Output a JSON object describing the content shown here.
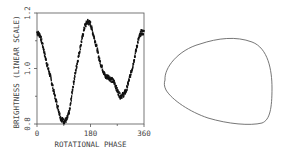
{
  "chart_data": [
    {
      "type": "scatter",
      "title": "",
      "xlabel": "ROTATIONAL PHASE",
      "ylabel": "BRIGHTNESS (LINEAR SCALE)",
      "xlim": [
        0,
        360
      ],
      "ylim": [
        0.8,
        1.2
      ],
      "xticks": [
        "0",
        "180",
        "360"
      ],
      "yticks": [
        "0.8",
        "1.0",
        "1.2"
      ],
      "grid": false,
      "legend": null,
      "series": [
        {
          "name": "lightcurve",
          "x": [
            0,
            10,
            20,
            30,
            45,
            60,
            70,
            80,
            90,
            100,
            110,
            120,
            135,
            150,
            160,
            170,
            180,
            190,
            200,
            210,
            220,
            230,
            240,
            250,
            260,
            270,
            280,
            290,
            300,
            310,
            320,
            330,
            340,
            350,
            360
          ],
          "y": [
            1.13,
            1.12,
            1.08,
            1.03,
            0.97,
            0.9,
            0.86,
            0.82,
            0.81,
            0.815,
            0.85,
            0.93,
            1.02,
            1.1,
            1.15,
            1.17,
            1.16,
            1.12,
            1.08,
            1.03,
            1.0,
            0.97,
            0.97,
            0.96,
            0.95,
            0.92,
            0.9,
            0.905,
            0.92,
            0.96,
            1.0,
            1.05,
            1.1,
            1.13,
            1.13
          ]
        }
      ]
    },
    {
      "type": "shape",
      "title": "",
      "description": "asteroid silhouette outline (rounded triangular shape)"
    }
  ],
  "labels": {
    "xlabel": "ROTATIONAL PHASE",
    "ylabel": "BRIGHTNESS (LINEAR SCALE)",
    "x_tick_0": "0",
    "x_tick_180": "180",
    "x_tick_360": "360",
    "y_tick_08": "0.8",
    "y_tick_10": "1.0",
    "y_tick_12": "1.2"
  }
}
